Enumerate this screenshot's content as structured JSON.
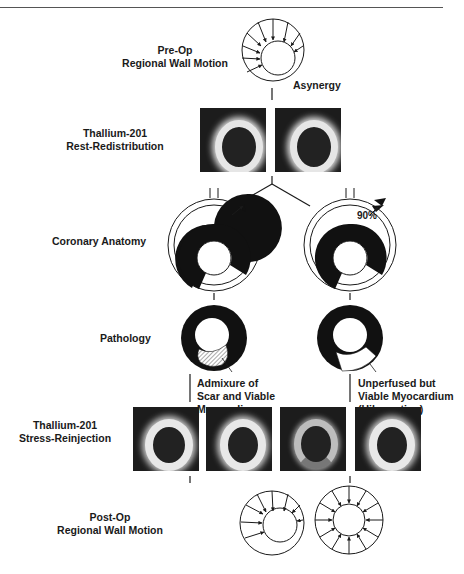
{
  "labels": {
    "preop": [
      "Pre-Op",
      "Regional Wall Motion"
    ],
    "asynergy": "Asynergy",
    "rest": [
      "Thallium-201",
      "Rest-Redistribution"
    ],
    "coronary": "Coronary Anatomy",
    "stenosis_left": "40%",
    "stenosis_right": "90%",
    "pathology": "Pathology",
    "path_left_note": [
      "Admixure of",
      "Scar and Viable",
      "Myocardium"
    ],
    "path_right_note": [
      "Unperfused but",
      "Viable Myocardium",
      "(Hibernating)"
    ],
    "stress": [
      "Thallium-201",
      "Stress-Reinjection"
    ],
    "postop": [
      "Post-Op",
      "Regional Wall Motion"
    ]
  },
  "colors": {
    "ink": "#1a1a1a",
    "scan_bg": "#1c1c1c",
    "scan_glow": "#e8e8e8"
  }
}
